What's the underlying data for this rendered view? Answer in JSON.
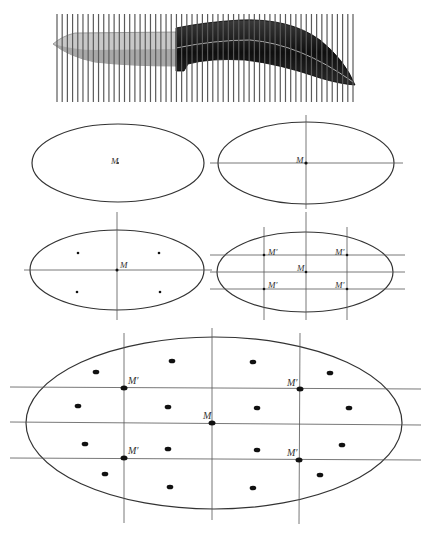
{
  "labels": {
    "center": "M",
    "image_point": "M′"
  },
  "colors": {
    "handle": "#1a1a1a",
    "blade": "#a8a8a8",
    "grid": "#5a5a5a",
    "stroke": "#333333"
  },
  "knife_grid": {
    "x_start": 57,
    "x_end": 353,
    "y_top": 14,
    "y_bottom": 102,
    "line_count": 58
  },
  "panels": [
    {
      "id": "panel-1",
      "description": "ellipse with center point M"
    },
    {
      "id": "panel-2",
      "description": "ellipse with two symmetry axes through M"
    },
    {
      "id": "panel-3",
      "description": "ellipse with axes and four symmetric points"
    },
    {
      "id": "panel-4",
      "description": "ellipse with grid lines and four image points M′"
    },
    {
      "id": "panel-5",
      "description": "large ellipse with grid, center M, four M′ points and scattered symmetric points"
    }
  ]
}
